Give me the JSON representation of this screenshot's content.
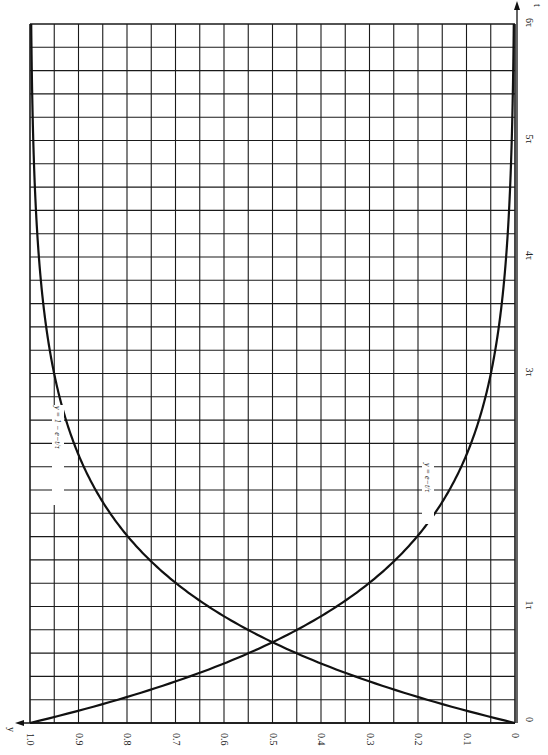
{
  "chart_data": {
    "type": "line",
    "title": "",
    "orientation_note": "figure rotated 90 degrees; y axis runs along bottom edge (1.0 at left, 0 at right), t axis runs up the right edge (0 at bottom, 6τ at top)",
    "xlabel": "t",
    "ylabel": "y",
    "x_ticks": [
      "0",
      "1τ",
      "3τ",
      "4τ",
      "5τ",
      "6τ"
    ],
    "x_tick_values": [
      0,
      1,
      3,
      4,
      5,
      6
    ],
    "y_ticks": [
      "1.0",
      "0.9",
      "0.8",
      "0.7",
      "0.6",
      "0.5",
      "0.4",
      "0.3",
      "0.2",
      "0.1",
      "0"
    ],
    "y_tick_values": [
      1.0,
      0.9,
      0.8,
      0.7,
      0.6,
      0.5,
      0.4,
      0.3,
      0.2,
      0.1,
      0
    ],
    "xlim": [
      0,
      6
    ],
    "ylim": [
      0,
      1.0
    ],
    "grid": true,
    "grid_x_step": 0.2,
    "grid_y_step": 0.05,
    "x": [
      0,
      0.2,
      0.4,
      0.6,
      0.8,
      1.0,
      1.5,
      2.0,
      2.5,
      3.0,
      3.5,
      4.0,
      4.5,
      5.0,
      5.5,
      6.0
    ],
    "series": [
      {
        "name": "y = e^{-t/τ}",
        "label": "y = e−t/τ",
        "values": [
          1.0,
          0.819,
          0.67,
          0.549,
          0.449,
          0.368,
          0.223,
          0.135,
          0.082,
          0.05,
          0.03,
          0.018,
          0.011,
          0.007,
          0.004,
          0.002
        ]
      },
      {
        "name": "y = 1 - e^{-t/τ}",
        "label": "y = 1 − e−t/τ",
        "values": [
          0.0,
          0.181,
          0.33,
          0.451,
          0.551,
          0.632,
          0.777,
          0.865,
          0.918,
          0.95,
          0.97,
          0.982,
          0.989,
          0.993,
          0.996,
          0.998
        ]
      }
    ]
  },
  "axis": {
    "y_axis_label": "y",
    "t_axis_label": "t"
  },
  "labels": {
    "decay_curve": "y = e−t/τ",
    "growth_curve": "y = 1 − e−t/τ"
  }
}
